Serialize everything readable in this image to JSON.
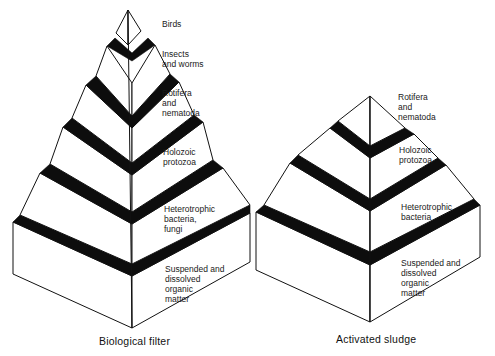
{
  "diagram": {
    "type": "trophic-pyramids",
    "pyramids": [
      {
        "caption": "Biological filter",
        "levels": [
          {
            "label": "Birds"
          },
          {
            "label": "Insects\nand worms"
          },
          {
            "label": "Rotifera\nand\nnematoda"
          },
          {
            "label": "Holozoic\nprotozoa"
          },
          {
            "label": "Heterotrophic\nbacteria,\nfungi"
          },
          {
            "label": "Suspended and\ndissolved\norganic\nmatter"
          }
        ]
      },
      {
        "caption": "Activated sludge",
        "levels": [
          {
            "label": "Rotifera\nand\nnematoda"
          },
          {
            "label": "Holozoic\nprotozoa"
          },
          {
            "label": "Heterotrophic\nbacteria"
          },
          {
            "label": "Suspended and\ndissolved\norganic\nmatter"
          }
        ]
      }
    ],
    "colors": {
      "line": "#111111",
      "band": "#0d0d0d",
      "background": "#ffffff"
    }
  }
}
